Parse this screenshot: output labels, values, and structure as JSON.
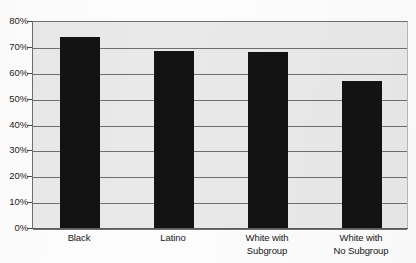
{
  "chart_data": {
    "type": "bar",
    "title": "",
    "subtitle": "",
    "xlabel": "",
    "ylabel": "",
    "categories": [
      "Black",
      "Latino",
      "White with Subgroup",
      "White with No Subgroup"
    ],
    "category_lines": [
      [
        "Black"
      ],
      [
        "Latino"
      ],
      [
        "White with",
        "Subgroup"
      ],
      [
        "White with",
        "No Subgroup"
      ]
    ],
    "values": [
      74,
      68.5,
      68,
      57
    ],
    "value_labels": [
      "74%",
      "68.5%",
      "68%",
      "57%"
    ],
    "ylim": [
      0,
      80
    ],
    "ytick_values": [
      0,
      10,
      20,
      30,
      40,
      50,
      60,
      70,
      80
    ],
    "ytick_labels": [
      "0%",
      "10%",
      "20%",
      "30%",
      "40%",
      "50%",
      "60%",
      "70%",
      "80%"
    ],
    "grid": true,
    "legend": null,
    "legend_position": "none",
    "annotations": [],
    "colors": {
      "bar": "#131313",
      "plot_background": "#e9e9e9",
      "gridline": "#6f6f6f",
      "axis": "#5a5a5a",
      "text": "#171717",
      "page_background": "#fdfdfd"
    }
  }
}
